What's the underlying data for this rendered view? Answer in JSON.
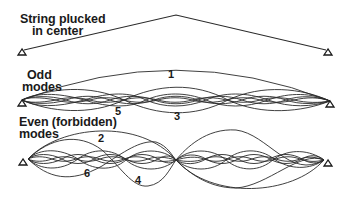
{
  "sections": {
    "plucked": {
      "title_line1": "String plucked",
      "title_line2": "in center"
    },
    "odd": {
      "title_line1": "Odd",
      "title_line2": "modes",
      "mode_labels": [
        "1",
        "3",
        "5"
      ]
    },
    "even": {
      "title_line1": "Even (forbidden)",
      "title_line2": "modes",
      "mode_labels": [
        "2",
        "4",
        "6"
      ]
    }
  },
  "colors": {
    "line": "#2a2a2a",
    "text": "#1a1a1a",
    "background": "#ffffff"
  }
}
